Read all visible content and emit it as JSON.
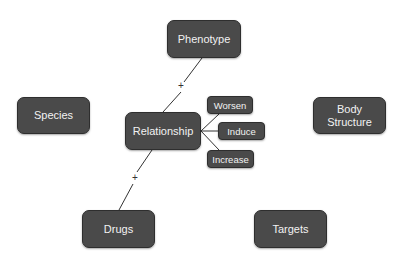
{
  "diagram": {
    "colors": {
      "node_fill": "#4a4a4a",
      "node_text": "#f2f2f2",
      "edge": "#333333",
      "background": "#ffffff"
    },
    "nodes": {
      "phenotype": {
        "label": "Phenotype"
      },
      "relationship": {
        "label": "Relationship"
      },
      "worsen": {
        "label": "Worsen"
      },
      "induce": {
        "label": "Induce"
      },
      "increase": {
        "label": "Increase"
      },
      "species": {
        "label": "Species"
      },
      "body_structure": {
        "label": "Body Structure"
      },
      "drugs": {
        "label": "Drugs"
      },
      "targets": {
        "label": "Targets"
      }
    },
    "edges": [
      {
        "from": "relationship",
        "to": "phenotype",
        "label": "+"
      },
      {
        "from": "relationship",
        "to": "drugs",
        "label": "+"
      },
      {
        "from": "relationship",
        "to": "worsen",
        "label": ""
      },
      {
        "from": "relationship",
        "to": "induce",
        "label": ""
      },
      {
        "from": "relationship",
        "to": "increase",
        "label": ""
      }
    ]
  }
}
